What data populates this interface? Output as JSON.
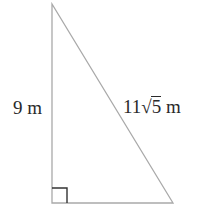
{
  "diagram": {
    "type": "right-triangle",
    "stroke_color": "#a9a9a9",
    "right_angle_marker_color": "#333333",
    "vertices": {
      "top": [
        52,
        4
      ],
      "bottom_left": [
        52,
        203
      ],
      "bottom_right": [
        173,
        203
      ]
    },
    "right_angle_at": "bottom_left",
    "labels": {
      "left_side": {
        "value": "9",
        "unit": "m",
        "text": "9 m"
      },
      "hypotenuse": {
        "coefficient": "11",
        "radical_symbol": "√",
        "radicand": "5",
        "unit": "m",
        "text": "11√5 m"
      }
    }
  }
}
